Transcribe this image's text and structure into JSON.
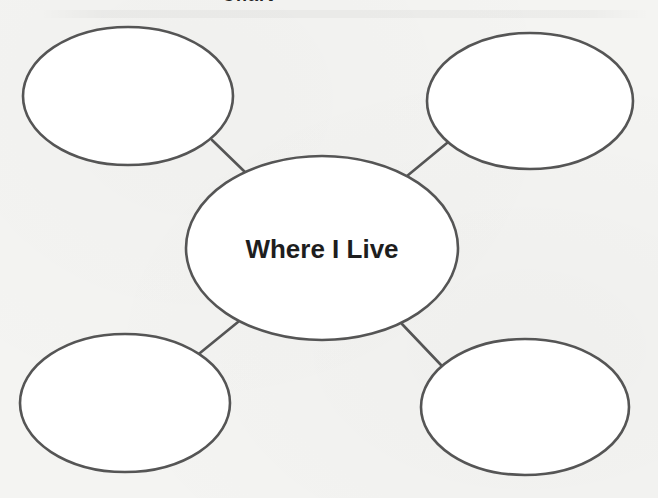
{
  "heading": {
    "cutoff_text": "Chart"
  },
  "web": {
    "center": {
      "label": "Where I Live",
      "cx": 322,
      "cy": 248,
      "rx": 136,
      "ry": 92
    },
    "outer": [
      {
        "id": "top-left",
        "label": "",
        "cx": 128,
        "cy": 96,
        "rx": 105,
        "ry": 69
      },
      {
        "id": "top-right",
        "label": "",
        "cx": 530,
        "cy": 101,
        "rx": 103,
        "ry": 68
      },
      {
        "id": "bottom-left",
        "label": "",
        "cx": 125,
        "cy": 403,
        "rx": 105,
        "ry": 69
      },
      {
        "id": "bottom-right",
        "label": "",
        "cx": 525,
        "cy": 407,
        "rx": 104,
        "ry": 68
      }
    ],
    "connectors": [
      {
        "id": "top-left",
        "x1": 212,
        "y1": 140,
        "x2": 246,
        "y2": 173
      },
      {
        "id": "top-right",
        "x1": 447,
        "y1": 143,
        "x2": 407,
        "y2": 176
      },
      {
        "id": "bottom-left",
        "x1": 200,
        "y1": 353,
        "x2": 238,
        "y2": 322
      },
      {
        "id": "bottom-right",
        "x1": 441,
        "y1": 365,
        "x2": 402,
        "y2": 324
      }
    ]
  },
  "colors": {
    "stroke": "#555555",
    "text": "#1e1e1e",
    "background": "#f4f4f2",
    "fill": "#ffffff"
  }
}
